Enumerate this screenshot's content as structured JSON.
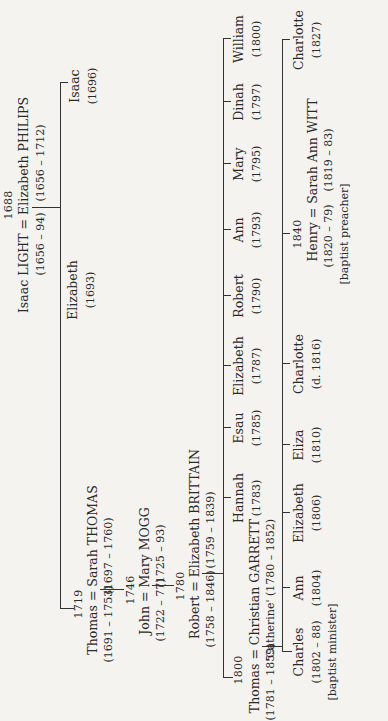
{
  "gen1": {
    "marriage_year": "1688",
    "couple": "Isaac LIGHT = Elizabeth PHILIPS",
    "husband_dates": "(1656 – 94)",
    "wife_dates": "(1656 – 1712)",
    "children": [
      {
        "name": "Thomas",
        "note": "see gen2"
      },
      {
        "name": "Elizabeth",
        "dates": "(1693)"
      },
      {
        "name": "Isaac",
        "dates": "(1696)"
      }
    ]
  },
  "gen2": {
    "marriage_year": "1719",
    "couple": "Thomas = Sarah THOMAS",
    "husband_dates": "(1691 – 1753)",
    "wife_dates": "(1697 – 1760)"
  },
  "gen3": {
    "marriage_year": "1746",
    "couple": "John = Mary MOGG",
    "husband_dates": "(1722 – 77)",
    "wife_dates": "(1725 – 93)"
  },
  "gen4": {
    "marriage_year": "1780",
    "couple": "Robert = Elizabeth BRITTAIN",
    "husband_dates": "(1758 – 1846)",
    "wife_dates": "(1759 – 1839)",
    "children": [
      {
        "name": "Thomas",
        "note": "see gen5"
      },
      {
        "name": "Hannah",
        "dates": "(1783)"
      },
      {
        "name": "Esau",
        "dates": "(1785)"
      },
      {
        "name": "Elizabeth",
        "dates": "(1787)"
      },
      {
        "name": "Robert",
        "dates": "(1790)"
      },
      {
        "name": "Ann",
        "dates": "(1793)"
      },
      {
        "name": "Mary",
        "dates": "(1795)"
      },
      {
        "name": "Dinah",
        "dates": "(1797)"
      },
      {
        "name": "William",
        "dates": "(1800)"
      }
    ]
  },
  "gen5": {
    "marriage_year": "1800",
    "couple": "Thomas = Christian GARRETT",
    "husband_dates": "(1781 – 1859)",
    "wife_alias": "'Catherine' (1780 – 1852)",
    "children": [
      {
        "name": "Charles",
        "dates": "(1802 – 88)",
        "note": "[baptist minister]"
      },
      {
        "name": "Ann",
        "dates": "(1804)"
      },
      {
        "name": "Elizabeth",
        "dates": "(1806)"
      },
      {
        "name": "Eliza",
        "dates": "(1810)"
      },
      {
        "name": "Charlotte",
        "dates": "(d. 1816)"
      },
      {
        "name": "Henry",
        "note": "see gen6"
      },
      {
        "name": "Charlotte",
        "dates": "(1827)"
      }
    ]
  },
  "gen6": {
    "marriage_year": "1840",
    "couple": "Henry = Sarah Ann WITT",
    "husband_dates": "(1820 – 79)",
    "wife_dates": "(1819 – 83)",
    "note": "[baptist preacher]"
  }
}
